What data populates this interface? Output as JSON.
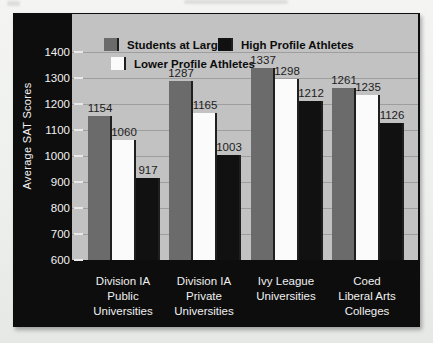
{
  "page": {
    "background": "#eef0ee",
    "artifacts": {
      "page_number_smudge": "illegible",
      "running_header_smudge": "illegible"
    }
  },
  "palette": {
    "panel_bg": "#0d0d0d",
    "plot_bg": "#c2c2c2",
    "gridline": "#9e9e9e",
    "axis_text": "#f2f2f2",
    "value_label_text": "#1c1c1c",
    "bar_edge_shadow": "#1f1f1f"
  },
  "chart_data": {
    "type": "bar",
    "title": "",
    "xlabel": "",
    "ylabel": "Average SAT Scores",
    "ylim": [
      600,
      1546
    ],
    "yticks": [
      600,
      700,
      800,
      900,
      1000,
      1100,
      1200,
      1300,
      1400
    ],
    "grid": "horizontal",
    "bar_value_labels": true,
    "legend_position": "top-left-inside",
    "legend_rows": [
      [
        "Students at Large",
        "High Profile Athletes"
      ],
      [
        "Lower Profile Athletes"
      ]
    ],
    "categories": [
      [
        "Division IA",
        "Public",
        "Universities"
      ],
      [
        "Division IA",
        "Private",
        "Universities"
      ],
      [
        "Ivy League",
        "Universities"
      ],
      [
        "Coed",
        "Liberal Arts",
        "Colleges"
      ]
    ],
    "series": [
      {
        "name": "Students at Large",
        "color": "#6b6b6b",
        "values": [
          1154,
          1287,
          1337,
          1261
        ]
      },
      {
        "name": "Lower Profile Athletes",
        "color": "#fbfbfb",
        "values": [
          1060,
          1165,
          1298,
          1235
        ]
      },
      {
        "name": "High Profile Athletes",
        "color": "#111111",
        "values": [
          917,
          1003,
          1212,
          1126
        ]
      }
    ]
  }
}
